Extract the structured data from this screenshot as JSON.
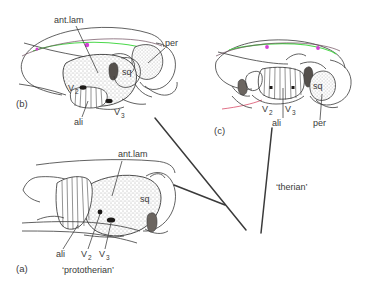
{
  "figure": {
    "type": "anatomical-diagram",
    "background": "#ffffff",
    "ink_color": "#3a3a3a",
    "accent_green": "#4cd94c",
    "accent_magenta": "#d63fd6",
    "accent_red": "#d94c6a",
    "stipple_fill": "#f2f0ee",
    "dark_fill": "#55504c"
  },
  "panels": {
    "a": {
      "id": "(a)",
      "caption": "‘prototherian’",
      "labels": {
        "ant_lam": "ant.lam",
        "sq": "sq",
        "ali": "ali",
        "v2": "V",
        "v2_sub": "2",
        "v3": "V",
        "v3_sub": "3"
      }
    },
    "b": {
      "id": "(b)",
      "caption": "",
      "labels": {
        "ant_lam": "ant.lam",
        "per": "per",
        "sq": "sq",
        "ali": "ali",
        "v2": "V",
        "v2_sub": "2",
        "v3": "V",
        "v3_sub": "3"
      }
    },
    "c": {
      "id": "(c)",
      "caption": "‘therian’",
      "labels": {
        "sq": "sq",
        "ali": "ali",
        "per": "per",
        "v2": "V",
        "v2_sub": "2",
        "v3": "V",
        "v3_sub": "3"
      }
    }
  },
  "cladogram": {
    "node_label": "",
    "terminal_left": "‘prototherian’",
    "terminal_right": "‘therian’"
  }
}
